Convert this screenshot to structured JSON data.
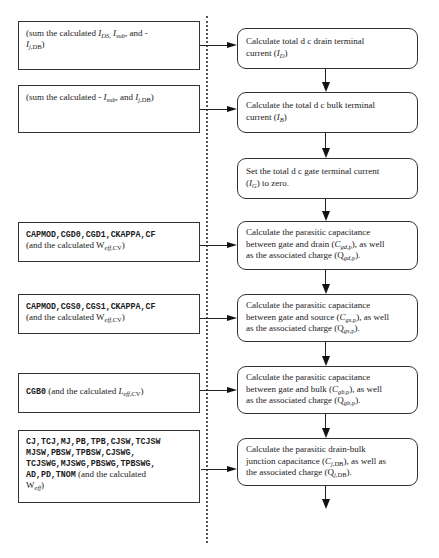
{
  "header": {
    "text": ""
  },
  "inputs": [
    {
      "id": "drain-inputs",
      "parts": [
        {
          "t": "(sum the calculated  "
        },
        {
          "t": "I",
          "i": true
        },
        {
          "sub": "DS,",
          "i": true
        },
        {
          "t": " "
        },
        {
          "t": "I",
          "i": true
        },
        {
          "sub": "sub",
          "i": true
        },
        {
          "t": ", and -"
        },
        {
          "br": true
        },
        {
          "t": "I",
          "i": true
        },
        {
          "sub": "j,",
          "i": true
        },
        {
          "sub": "DB"
        },
        {
          "t": ")"
        }
      ]
    },
    {
      "id": "bulk-inputs",
      "parts": [
        {
          "t": "(sum the calculated  - "
        },
        {
          "t": "I",
          "i": true
        },
        {
          "sub": "sub",
          "i": true
        },
        {
          "t": ", and "
        },
        {
          "t": "I",
          "i": true
        },
        {
          "sub": "j,",
          "i": true
        },
        {
          "sub": "DB"
        },
        {
          "t": ")"
        }
      ]
    },
    {
      "id": "cgd-inputs",
      "parts": [
        {
          "m": "CAPMOD,CGD0,CGD1,CKAPPA,CF"
        },
        {
          "br": true
        },
        {
          "t": "(and the calculated  W"
        },
        {
          "sub": "eff,",
          "i": true
        },
        {
          "sub": "CV"
        },
        {
          "t": ")"
        }
      ]
    },
    {
      "id": "cgs-inputs",
      "parts": [
        {
          "m": "CAPMOD,CGS0,CGS1,CKAPPA,CF"
        },
        {
          "br": true
        },
        {
          "t": "(and the calculated  W"
        },
        {
          "sub": "eff,",
          "i": true
        },
        {
          "sub": "CV"
        },
        {
          "t": ")"
        }
      ]
    },
    {
      "id": "cgb-inputs",
      "parts": [
        {
          "m": "CGB0"
        },
        {
          "t": "  (and the calculated  "
        },
        {
          "t": "L",
          "i": true
        },
        {
          "sub": "eff,",
          "i": true
        },
        {
          "sub": "CV"
        },
        {
          "t": ")"
        }
      ]
    },
    {
      "id": "junction-inputs",
      "parts": [
        {
          "m": "CJ,TCJ,MJ,PB,TPB,CJSW,TCJSW"
        },
        {
          "br": true
        },
        {
          "m": "MJSW,PBSW,TPBSW,CJSWG,"
        },
        {
          "br": true
        },
        {
          "m": "TCJSWG,MJSWG,PBSWG,TPBSWG,"
        },
        {
          "br": true
        },
        {
          "m": "AD,PD,TNOM"
        },
        {
          "t": "  (and the calculated"
        },
        {
          "br": true
        },
        {
          "t": "W"
        },
        {
          "sub": "eff",
          "i": true
        },
        {
          "t": ")"
        }
      ]
    }
  ],
  "steps": [
    {
      "id": "drain-current",
      "parts": [
        {
          "t": "Calculate total d c  drain terminal"
        },
        {
          "br": true
        },
        {
          "t": "current ("
        },
        {
          "t": "I",
          "i": true
        },
        {
          "sub": "D",
          "i": true
        },
        {
          "t": ")"
        }
      ]
    },
    {
      "id": "bulk-current",
      "parts": [
        {
          "t": "Calculate the total d c  bulk terminal"
        },
        {
          "br": true
        },
        {
          "t": "current ("
        },
        {
          "t": "I",
          "i": true
        },
        {
          "sub": "B",
          "i": true
        },
        {
          "t": ")"
        }
      ]
    },
    {
      "id": "gate-current",
      "parts": [
        {
          "t": "Set the total d c  gate terminal current"
        },
        {
          "br": true
        },
        {
          "t": "("
        },
        {
          "t": "I",
          "i": true
        },
        {
          "sub": "G",
          "i": true
        },
        {
          "t": ") to zero."
        }
      ]
    },
    {
      "id": "cgd",
      "parts": [
        {
          "t": "Calculate the parasitic capacitance"
        },
        {
          "br": true
        },
        {
          "t": "between gate and drain ("
        },
        {
          "t": "C",
          "i": true
        },
        {
          "sub": "gd,",
          "i": true
        },
        {
          "sub": "p"
        },
        {
          "t": "), as well"
        },
        {
          "br": true
        },
        {
          "t": "as the associated charge (Q"
        },
        {
          "sub": "gd,",
          "i": true
        },
        {
          "sub": "p"
        },
        {
          "t": ")."
        }
      ]
    },
    {
      "id": "cgs",
      "parts": [
        {
          "t": "Calculate the parasitic capacitance"
        },
        {
          "br": true
        },
        {
          "t": "between gate and source ("
        },
        {
          "t": "C",
          "i": true
        },
        {
          "sub": "gs,",
          "i": true
        },
        {
          "sub": "p"
        },
        {
          "t": "), as well"
        },
        {
          "br": true
        },
        {
          "t": "as the associated charge (Q"
        },
        {
          "sub": "gs,",
          "i": true
        },
        {
          "sub": "p"
        },
        {
          "t": ")."
        }
      ]
    },
    {
      "id": "cgb",
      "parts": [
        {
          "t": "Calculate the parasitic capacitance"
        },
        {
          "br": true
        },
        {
          "t": "between gate and bulk ("
        },
        {
          "t": "C",
          "i": true
        },
        {
          "sub": "gb,",
          "i": true
        },
        {
          "sub": "p"
        },
        {
          "t": "), as well"
        },
        {
          "br": true
        },
        {
          "t": "as the associated charge (Q"
        },
        {
          "sub": "gb,",
          "i": true
        },
        {
          "sub": "p"
        },
        {
          "t": ")."
        }
      ]
    },
    {
      "id": "cjdb",
      "parts": [
        {
          "t": "Calculate the parasitic drain-bulk"
        },
        {
          "br": true
        },
        {
          "t": "junction capacitance ("
        },
        {
          "t": "C",
          "i": true
        },
        {
          "sub": "j,",
          "i": true
        },
        {
          "sub": "DB"
        },
        {
          "t": "), as well as"
        },
        {
          "br": true
        },
        {
          "t": "the associated charge (Q"
        },
        {
          "sub": "j,",
          "i": true
        },
        {
          "sub": "DB"
        },
        {
          "t": ")."
        }
      ]
    }
  ],
  "colors": {
    "line": "#222222",
    "border": "#333333",
    "divider": "#555555"
  }
}
